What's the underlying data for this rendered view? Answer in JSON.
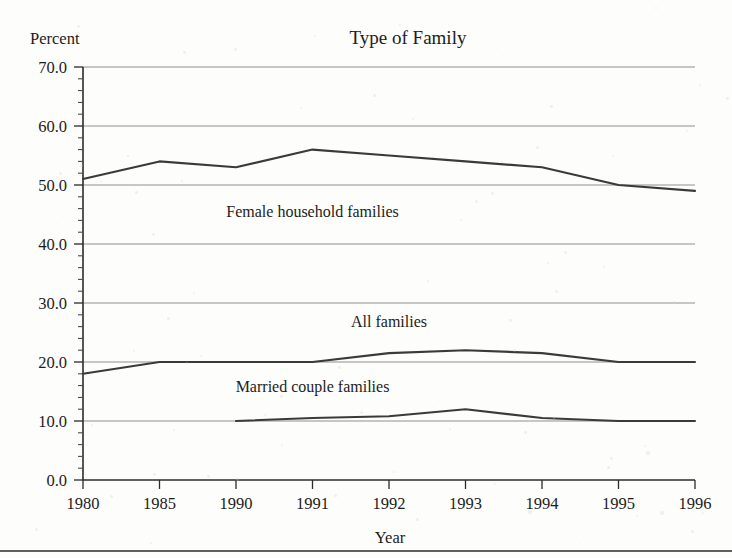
{
  "chart_data": {
    "type": "line",
    "title": "Type of Family",
    "xlabel": "Year",
    "ylabel": "Percent",
    "categories": [
      "1980",
      "1985",
      "1990",
      "1991",
      "1992",
      "1993",
      "1994",
      "1995",
      "1996"
    ],
    "ylim": [
      0.0,
      70.0
    ],
    "ytick_labels": [
      "0.0",
      "10.0",
      "20.0",
      "30.0",
      "40.0",
      "50.0",
      "60.0",
      "70.0"
    ],
    "ytick_values": [
      0.0,
      10.0,
      20.0,
      30.0,
      40.0,
      50.0,
      60.0,
      70.0
    ],
    "ytick_minor_step": 2.0,
    "grid": "horizontal",
    "legend": "inline-annotations",
    "series": [
      {
        "name": "Female household families",
        "x": [
          "1980",
          "1985",
          "1990",
          "1991",
          "1992",
          "1993",
          "1994",
          "1995",
          "1996"
        ],
        "values": [
          51.0,
          54.0,
          53.0,
          56.0,
          55.0,
          54.0,
          53.0,
          50.0,
          49.0
        ],
        "label_x": "1991",
        "label_y": 44.5
      },
      {
        "name": "All families",
        "x": [
          "1980",
          "1985",
          "1990",
          "1991",
          "1992",
          "1993",
          "1994",
          "1995",
          "1996"
        ],
        "values": [
          18.0,
          20.0,
          20.0,
          20.0,
          21.5,
          22.0,
          21.5,
          20.0,
          20.0
        ],
        "label_x": "1992",
        "label_y": 26.0
      },
      {
        "name": "Married couple families",
        "x": [
          "1990",
          "1991",
          "1992",
          "1993",
          "1994",
          "1995",
          "1996"
        ],
        "values": [
          10.0,
          10.5,
          10.8,
          12.0,
          10.5,
          10.0,
          10.0
        ],
        "label_x": "1991",
        "label_y": 15.0
      }
    ]
  }
}
